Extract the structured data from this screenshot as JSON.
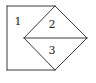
{
  "diagram": {
    "title": "",
    "stroke_color": "#3a3a3a",
    "background_color": "#ffffff",
    "points": {
      "A": {
        "x": 7,
        "y": 6
      },
      "B": {
        "x": 55,
        "y": 6
      },
      "C": {
        "x": 87,
        "y": 38
      },
      "D": {
        "x": 55,
        "y": 70
      },
      "E": {
        "x": 7,
        "y": 70
      },
      "F": {
        "x": 24,
        "y": 38
      }
    },
    "regions": [
      {
        "id": "region-1",
        "label": "1",
        "label_pos": {
          "x": 18,
          "y": 22
        }
      },
      {
        "id": "region-2",
        "label": "2",
        "label_pos": {
          "x": 52,
          "y": 25
        }
      },
      {
        "id": "region-3",
        "label": "3",
        "label_pos": {
          "x": 52,
          "y": 51
        }
      }
    ]
  }
}
